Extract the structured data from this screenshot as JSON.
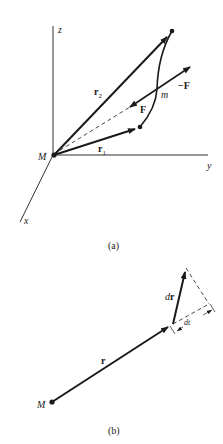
{
  "figure_a": {
    "caption": "(a)",
    "axes": {
      "z": "z",
      "y": "y",
      "x": "x"
    },
    "origin_label": "M",
    "vectors": {
      "r2": {
        "base": "r",
        "sub": "2"
      },
      "r1": {
        "base": "r",
        "sub": "1"
      },
      "F": "F",
      "negF": "−F"
    },
    "point_label": "m"
  },
  "figure_b": {
    "caption": "(b)",
    "origin_label": "M",
    "r_label": "r",
    "dr_label": {
      "d": "d",
      "r": "r"
    },
    "dt_label": "dt"
  },
  "colors": {
    "ink": "#1a1a1a",
    "background": "#ffffff"
  }
}
